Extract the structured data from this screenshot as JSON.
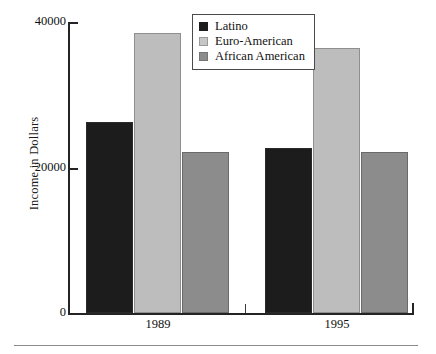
{
  "chart_data": {
    "type": "bar",
    "title": "",
    "xlabel": "",
    "ylabel": "Income in Dollars",
    "categories": [
      "1989",
      "1995"
    ],
    "series": [
      {
        "name": "Latino",
        "color": "#1c1c1c",
        "values": [
          26250,
          22700
        ]
      },
      {
        "name": "Euro-American",
        "color": "#bdbdbd",
        "values": [
          38500,
          36400
        ]
      },
      {
        "name": "African American",
        "color": "#8c8c8c",
        "values": [
          22100,
          22100
        ]
      }
    ],
    "ylim": [
      0,
      40000
    ],
    "yticks": [
      0,
      20000,
      40000
    ],
    "ytick_labels": [
      "0",
      "20000",
      "40000"
    ],
    "grid": false,
    "legend_position": "top-center"
  },
  "axes": {
    "y_label": "Income in Dollars",
    "y_ticks": [
      {
        "label": "40000"
      },
      {
        "label": "20000"
      },
      {
        "label": "0"
      }
    ],
    "x_groups": [
      {
        "label": "1989"
      },
      {
        "label": "1995"
      }
    ]
  },
  "legend": {
    "items": [
      {
        "label": "Latino"
      },
      {
        "label": "Euro-American"
      },
      {
        "label": "African American"
      }
    ]
  }
}
